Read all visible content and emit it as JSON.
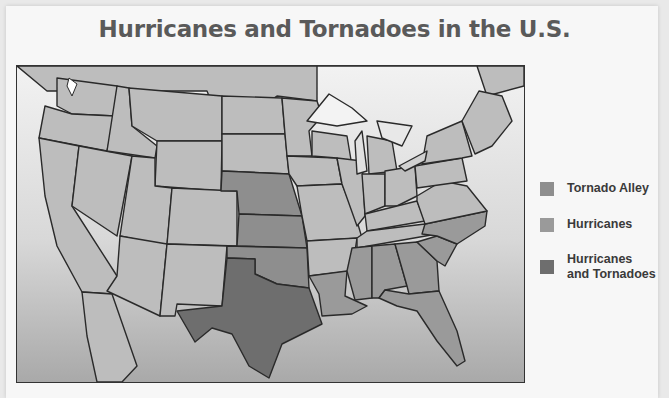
{
  "title": "Hurricanes and Tornadoes in the U.S.",
  "legend": {
    "items": [
      {
        "label": "Tornado Alley",
        "color": "#8e8e8e"
      },
      {
        "label": "Hurricanes",
        "color": "#9a9a9a"
      },
      {
        "label": "Hurricanes and Tornadoes",
        "label_line1": "Hurricanes",
        "label_line2": "and Tornadoes",
        "color": "#6e6e6e"
      }
    ]
  },
  "colors": {
    "default_state": "#bdbdbd",
    "tornado_alley": "#8e8e8e",
    "hurricanes": "#9a9a9a",
    "hurricanes_and_tornadoes": "#6e6e6e",
    "border": "#2a2a2a"
  },
  "regions": {
    "tornado_alley": [
      "Nebraska",
      "Kansas",
      "Oklahoma"
    ],
    "hurricanes": [
      "Louisiana",
      "Mississippi",
      "Alabama",
      "Georgia",
      "Florida",
      "South Carolina",
      "North Carolina"
    ],
    "hurricanes_and_tornadoes": [
      "Texas"
    ]
  }
}
